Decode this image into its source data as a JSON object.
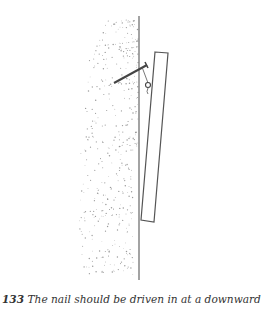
{
  "figure": {
    "colors": {
      "line": "#555555",
      "stipple": "#9a9a9a",
      "background": "#ffffff"
    }
  },
  "caption": {
    "number": "133",
    "text": "The nail should be driven in at a downward"
  }
}
